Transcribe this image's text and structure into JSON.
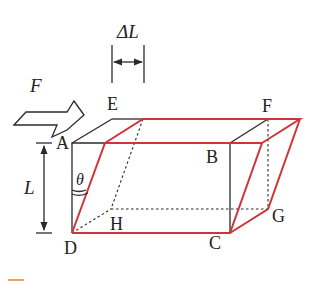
{
  "diagram": {
    "labels": {
      "force": "F",
      "delta_l": "ΔL",
      "length": "L",
      "angle": "θ",
      "A": "A",
      "B": "B",
      "C": "C",
      "D": "D",
      "E": "E",
      "F": "F",
      "G": "G",
      "H": "H"
    },
    "colors": {
      "original_outline": "#2a2a2a",
      "deformed_outline": "#d0343a",
      "accent_mark": "#f0a060"
    }
  }
}
